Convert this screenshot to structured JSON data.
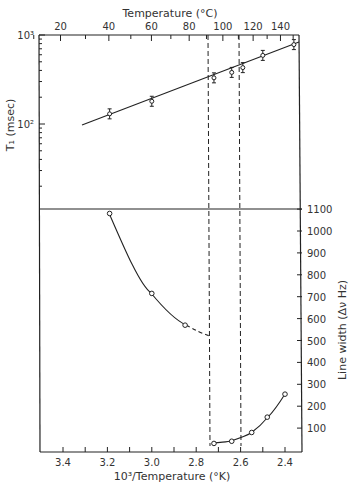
{
  "chart_data": [
    {
      "type": "scatter",
      "panel": "upper",
      "title": "",
      "xlabel": "10^3/Temperature (°K)",
      "x2label": "Temperature (°C)",
      "ylabel": "T1 (msec)",
      "yscale": "log",
      "ylim": [
        10,
        1000
      ],
      "y_tick_labels": [
        "10^2",
        "10^3"
      ],
      "x2_tick_labels": [
        "20",
        "40",
        "60",
        "80",
        "100",
        "120",
        "140"
      ],
      "series": [
        {
          "name": "T1",
          "marker": "open circle with error bars",
          "fit": "straight line",
          "x": [
            3.19,
            3.0,
            2.72,
            2.64,
            2.59,
            2.5,
            2.36
          ],
          "y": [
            130,
            180,
            330,
            380,
            430,
            590,
            780
          ]
        }
      ]
    },
    {
      "type": "line",
      "panel": "lower",
      "xlabel": "10^3/Temperature (°K)",
      "ylabel": "Line width (Δν Hz)",
      "xlim": [
        3.5,
        2.35
      ],
      "x_tick_labels": [
        "3.4",
        "3.2",
        "3.0",
        "2.8",
        "2.6",
        "2.4"
      ],
      "ylim": [
        0,
        1100
      ],
      "y_tick_labels": [
        "100",
        "200",
        "300",
        "400",
        "500",
        "600",
        "700",
        "800",
        "900",
        "1000",
        "1100"
      ],
      "series": [
        {
          "name": "low-temperature branch",
          "marker": "open circle",
          "x": [
            3.19,
            3.0,
            2.85
          ],
          "y": [
            1080,
            715,
            570
          ],
          "extrapolated_to": {
            "x": 2.73,
            "y": 520,
            "style": "dashed"
          }
        },
        {
          "name": "high-temperature branch",
          "marker": "open circle",
          "x": [
            2.72,
            2.64,
            2.55,
            2.48,
            2.4
          ],
          "y": [
            30,
            40,
            80,
            150,
            255
          ]
        }
      ],
      "annotations": [
        {
          "type": "vertical dashed line",
          "x": 2.73
        },
        {
          "type": "vertical dashed line",
          "x": 2.59
        }
      ]
    }
  ],
  "labels": {
    "top_axis_title": "Temperature (°C)",
    "top_ticks": [
      "20",
      "40",
      "60",
      "80",
      "100",
      "120",
      "140"
    ],
    "left_axis_title": "T₁ (msec)",
    "left_ticks": [
      "10³",
      "10²"
    ],
    "right_axis_title": "Line width (Δν Hz)",
    "right_ticks": [
      "1100",
      "1000",
      "900",
      "800",
      "700",
      "600",
      "500",
      "400",
      "300",
      "200",
      "100"
    ],
    "bottom_axis_title": "10³/Temperature (°K)",
    "bottom_ticks": [
      "3.4",
      "3.2",
      "3.0",
      "2.8",
      "2.6",
      "2.4"
    ]
  }
}
